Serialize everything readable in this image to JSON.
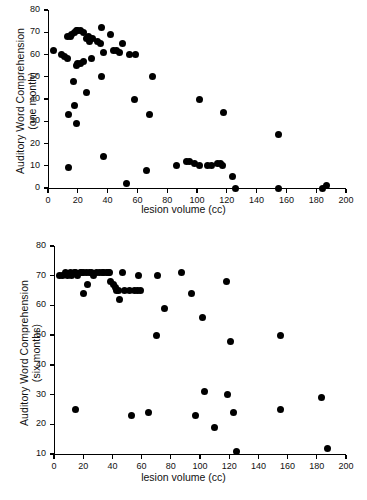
{
  "figure": {
    "panels": [
      {
        "id": "one-month",
        "xlabel": "lesion volume (cc)",
        "ylabel_line1": "Auditory Word Comprehension",
        "ylabel_line2": "(one month)"
      },
      {
        "id": "six-months",
        "xlabel": "lesion volume (cc)",
        "ylabel_line1": "Auditory Word Comprehension",
        "ylabel_line2": "(six months)"
      }
    ]
  },
  "chart_data": [
    {
      "type": "scatter",
      "title": "",
      "xlabel": "lesion volume (cc)",
      "ylabel": "Auditory Word Comprehension (one month)",
      "xlim": [
        0,
        200
      ],
      "ylim": [
        0,
        80
      ],
      "xticks": [
        0,
        20,
        40,
        60,
        80,
        100,
        120,
        140,
        160,
        180,
        200
      ],
      "yticks": [
        0,
        10,
        20,
        30,
        40,
        50,
        60,
        70,
        80
      ],
      "grid": false,
      "legend": false,
      "marker": "filled-circle",
      "marker_color": "#000000",
      "points": [
        [
          4,
          62
        ],
        [
          9,
          60
        ],
        [
          11,
          59
        ],
        [
          13,
          58
        ],
        [
          13,
          68
        ],
        [
          15,
          68
        ],
        [
          16,
          69
        ],
        [
          14,
          33
        ],
        [
          14,
          9
        ],
        [
          17,
          48
        ],
        [
          18,
          70
        ],
        [
          19,
          71
        ],
        [
          20,
          71
        ],
        [
          19,
          55
        ],
        [
          20,
          56
        ],
        [
          18,
          37
        ],
        [
          19,
          29
        ],
        [
          22,
          71
        ],
        [
          24,
          70
        ],
        [
          22,
          56
        ],
        [
          24,
          57
        ],
        [
          26,
          67
        ],
        [
          27,
          68
        ],
        [
          28,
          67
        ],
        [
          28,
          66
        ],
        [
          30,
          67
        ],
        [
          29,
          58
        ],
        [
          26,
          43
        ],
        [
          33,
          66
        ],
        [
          35,
          65
        ],
        [
          36,
          72
        ],
        [
          37,
          61
        ],
        [
          36,
          50
        ],
        [
          37,
          14
        ],
        [
          42,
          69
        ],
        [
          44,
          62
        ],
        [
          46,
          62
        ],
        [
          48,
          61
        ],
        [
          50,
          65
        ],
        [
          53,
          2
        ],
        [
          55,
          60
        ],
        [
          58,
          40
        ],
        [
          59,
          60
        ],
        [
          66,
          8
        ],
        [
          68,
          33
        ],
        [
          70,
          50
        ],
        [
          86,
          10
        ],
        [
          93,
          12
        ],
        [
          95,
          12
        ],
        [
          98,
          11
        ],
        [
          102,
          40
        ],
        [
          102,
          10
        ],
        [
          107,
          10
        ],
        [
          110,
          10
        ],
        [
          114,
          11
        ],
        [
          116,
          11
        ],
        [
          117,
          10
        ],
        [
          118,
          34
        ],
        [
          124,
          5
        ],
        [
          126,
          0
        ],
        [
          155,
          24
        ],
        [
          155,
          0
        ],
        [
          184,
          0
        ],
        [
          187,
          1
        ]
      ]
    },
    {
      "type": "scatter",
      "title": "",
      "xlabel": "lesion volume (cc)",
      "ylabel": "Auditory Word Comprehension (six months)",
      "xlim": [
        0,
        200
      ],
      "ylim": [
        10,
        80
      ],
      "xticks": [
        0,
        20,
        40,
        60,
        80,
        100,
        120,
        140,
        160,
        180,
        200
      ],
      "yticks": [
        10,
        20,
        30,
        40,
        50,
        60,
        70,
        80
      ],
      "grid": false,
      "legend": false,
      "marker": "filled-circle",
      "marker_color": "#000000",
      "points": [
        [
          4,
          70
        ],
        [
          6,
          70
        ],
        [
          8,
          71
        ],
        [
          9,
          70
        ],
        [
          11,
          71
        ],
        [
          12,
          70
        ],
        [
          14,
          71
        ],
        [
          15,
          71
        ],
        [
          16,
          70
        ],
        [
          15,
          25
        ],
        [
          18,
          71
        ],
        [
          19,
          71
        ],
        [
          20,
          71
        ],
        [
          20,
          64
        ],
        [
          22,
          71
        ],
        [
          23,
          67
        ],
        [
          24,
          71
        ],
        [
          26,
          71
        ],
        [
          27,
          70
        ],
        [
          29,
          71
        ],
        [
          31,
          71
        ],
        [
          33,
          71
        ],
        [
          34,
          71
        ],
        [
          36,
          71
        ],
        [
          37,
          71
        ],
        [
          38,
          71
        ],
        [
          39,
          68
        ],
        [
          41,
          67
        ],
        [
          42,
          66
        ],
        [
          43,
          65
        ],
        [
          44,
          65
        ],
        [
          45,
          62
        ],
        [
          47,
          71
        ],
        [
          48,
          65
        ],
        [
          52,
          65
        ],
        [
          53,
          23
        ],
        [
          55,
          65
        ],
        [
          57,
          65
        ],
        [
          58,
          70
        ],
        [
          59,
          65
        ],
        [
          65,
          24
        ],
        [
          70,
          50
        ],
        [
          71,
          70
        ],
        [
          76,
          59
        ],
        [
          87,
          71
        ],
        [
          94,
          64
        ],
        [
          97,
          23
        ],
        [
          102,
          56
        ],
        [
          103,
          31
        ],
        [
          110,
          19
        ],
        [
          118,
          68
        ],
        [
          119,
          30
        ],
        [
          121,
          48
        ],
        [
          123,
          24
        ],
        [
          125,
          11
        ],
        [
          155,
          25
        ],
        [
          155,
          50
        ],
        [
          183,
          29
        ],
        [
          187,
          12
        ]
      ]
    }
  ]
}
